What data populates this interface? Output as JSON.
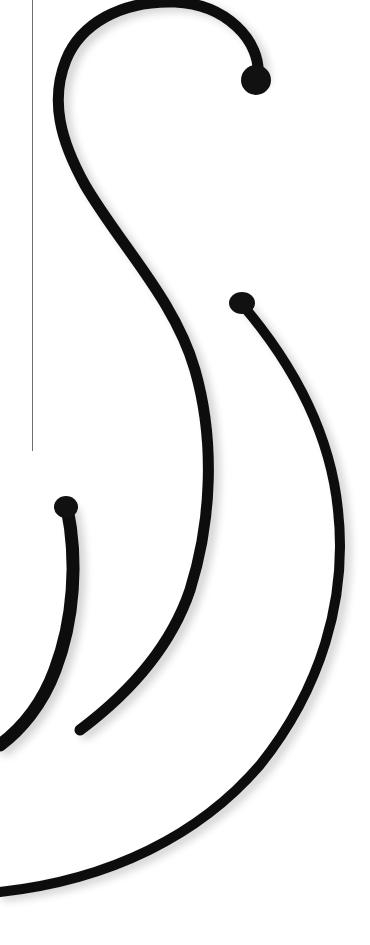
{
  "illustration": {
    "description": "Black calligraphic swirl strokes on white background",
    "background_color": "#ffffff",
    "stroke_color": "#111111",
    "rule_color": "#6e6e6e",
    "strokes": [
      {
        "name": "main-s-curve",
        "start": [
          258,
          75
        ],
        "end": [
          80,
          730
        ]
      },
      {
        "name": "right-arc",
        "start": [
          240,
          300
        ],
        "end": [
          0,
          890
        ]
      },
      {
        "name": "left-hook",
        "start": [
          67,
          505
        ],
        "end": [
          0,
          745
        ]
      }
    ],
    "rule": {
      "x": 32,
      "y_start": 0,
      "y_end": 451
    }
  }
}
